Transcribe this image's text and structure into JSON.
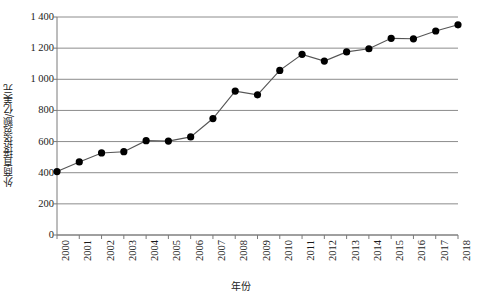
{
  "chart_data": {
    "type": "line",
    "title": "",
    "subtitle": "",
    "xlabel": "年份",
    "ylabel": "外商直接投资额/亿美元",
    "categories": [
      "2000",
      "2001",
      "2002",
      "2003",
      "2004",
      "2005",
      "2006",
      "2007",
      "2008",
      "2009",
      "2010",
      "2011",
      "2012",
      "2013",
      "2014",
      "2015",
      "2016",
      "2017",
      "2018"
    ],
    "values": [
      407,
      469,
      527,
      535,
      606,
      603,
      630,
      748,
      924,
      900,
      1057,
      1160,
      1117,
      1176,
      1196,
      1263,
      1260,
      1310,
      1350
    ],
    "series": [
      {
        "name": "外商直接投资额",
        "values": [
          407,
          469,
          527,
          535,
          606,
          603,
          630,
          748,
          924,
          900,
          1057,
          1160,
          1117,
          1176,
          1196,
          1263,
          1260,
          1310,
          1350
        ]
      }
    ],
    "ylim": [
      0,
      1400
    ],
    "yticks": [
      0,
      200,
      400,
      600,
      800,
      1000,
      1200,
      1400
    ],
    "ytick_labels": [
      "0",
      "200",
      "400",
      "600",
      "800",
      "1 000",
      "1 200",
      "1 400"
    ],
    "xlim": [
      "2000",
      "2018"
    ],
    "grid": "horizontal",
    "legend": "none",
    "marker": "filled-circle",
    "line_color": "#555555",
    "marker_color": "#000000",
    "grid_color": "#8c8c8c",
    "axis_color": "#7a7a7a",
    "background_color": "#ffffff"
  },
  "axes": {
    "y_title": "外商直接投资额/亿美元",
    "x_title": "年份"
  }
}
